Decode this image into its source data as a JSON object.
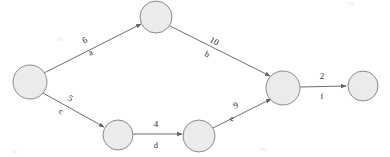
{
  "figure": {
    "type": "directed-weighted-graph",
    "background_color": "#ffffff",
    "node_fill": "#ebebeb",
    "node_stroke": "#8a8a8a",
    "edge_stroke": "#6e6e6e",
    "text_color": "#2b2b2b"
  },
  "graph_data": {
    "type": "diagram",
    "directed": true,
    "node_radius": 16,
    "nodes": [
      {
        "id": "n1",
        "label": "",
        "cx": 30,
        "cy": 82,
        "r": 17,
        "name": "source-node"
      },
      {
        "id": "n2",
        "label": "",
        "cx": 156,
        "cy": 17,
        "r": 16,
        "name": "upper-node"
      },
      {
        "id": "n3",
        "label": "",
        "cx": 118,
        "cy": 135,
        "r": 15,
        "name": "lower-left-node"
      },
      {
        "id": "n4",
        "label": "",
        "cx": 199,
        "cy": 136,
        "r": 16,
        "name": "lower-middle-node"
      },
      {
        "id": "n5",
        "label": "",
        "cx": 283,
        "cy": 88,
        "r": 17,
        "name": "merge-node"
      },
      {
        "id": "n6",
        "label": "",
        "cx": 363,
        "cy": 86,
        "r": 15,
        "name": "sink-node"
      }
    ],
    "edges": [
      {
        "id": "a",
        "from": "n1",
        "to": "n2",
        "weight": "6",
        "name": "a",
        "x1": 44,
        "y1": 73,
        "x2": 141,
        "y2": 24,
        "weight_x": 85,
        "weight_y": 41,
        "label_x": 91,
        "label_y": 53,
        "rotate": -26
      },
      {
        "id": "b",
        "from": "n2",
        "to": "n5",
        "weight": "10",
        "name": "b",
        "x1": 170,
        "y1": 26,
        "x2": 270,
        "y2": 76,
        "weight_x": 214,
        "weight_y": 42,
        "label_x": 207,
        "label_y": 55,
        "rotate": 27
      },
      {
        "id": "c",
        "from": "n1",
        "to": "n3",
        "weight": "5",
        "name": "c",
        "x1": 43,
        "y1": 93,
        "x2": 104,
        "y2": 127,
        "weight_x": 70,
        "weight_y": 99,
        "label_x": 61,
        "label_y": 112,
        "rotate": 29
      },
      {
        "id": "d",
        "from": "n3",
        "to": "n4",
        "weight": "4",
        "name": "d",
        "x1": 133,
        "y1": 134,
        "x2": 182,
        "y2": 134,
        "weight_x": 156,
        "weight_y": 125,
        "label_x": 156,
        "label_y": 146,
        "rotate": 0
      },
      {
        "id": "e",
        "from": "n4",
        "to": "n5",
        "weight": "9",
        "name": "e",
        "x1": 213,
        "y1": 128,
        "x2": 271,
        "y2": 99,
        "weight_x": 236,
        "weight_y": 106,
        "label_x": 232,
        "label_y": 119,
        "rotate": -26
      },
      {
        "id": "f",
        "from": "n5",
        "to": "n6",
        "weight": "2",
        "name": "f",
        "x1": 300,
        "y1": 87,
        "x2": 346,
        "y2": 86,
        "weight_x": 322,
        "weight_y": 77,
        "label_x": 322,
        "label_y": 97,
        "rotate": 0
      }
    ],
    "edge_ids": [
      "a",
      "b",
      "c",
      "d",
      "e",
      "f"
    ],
    "weights": [
      "6",
      "10",
      "5",
      "4",
      "9",
      "2"
    ],
    "arrowhead": "filled-triangle"
  }
}
